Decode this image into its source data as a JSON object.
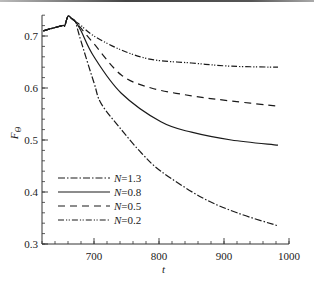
{
  "chart_data": {
    "type": "line",
    "title": "",
    "xlabel": "t",
    "ylabel": "F_Θ",
    "xlim": [
      620,
      1000
    ],
    "ylim": [
      0.3,
      0.74
    ],
    "xticks": [
      700,
      800,
      900,
      1000
    ],
    "xtick_labels": [
      "700",
      "800",
      "900",
      "1000"
    ],
    "x_minor_step": 20,
    "yticks": [
      0.3,
      0.4,
      0.5,
      0.6,
      0.7
    ],
    "ytick_labels": [
      "0.3",
      "0.4",
      "0.5",
      "0.6",
      "0.7"
    ],
    "y_minor_step": 0.02,
    "grid": false,
    "legend_position": "lower left",
    "shared_prefix": {
      "x": [
        622,
        651,
        655,
        660,
        666,
        671
      ],
      "y": [
        0.71,
        0.72,
        0.72,
        0.738,
        0.733,
        0.728
      ]
    },
    "series": [
      {
        "name": "N=1.3",
        "style": "dash-dot",
        "x": [
          680,
          700,
          711,
          742,
          773,
          803,
          865,
          920,
          983
        ],
        "y": [
          0.69,
          0.61,
          0.57,
          0.52,
          0.475,
          0.44,
          0.39,
          0.36,
          0.335
        ]
      },
      {
        "name": "N=0.8",
        "style": "solid",
        "x": [
          680,
          700,
          742,
          803,
          850,
          911,
          983
        ],
        "y": [
          0.71,
          0.66,
          0.59,
          0.535,
          0.515,
          0.5,
          0.49
        ]
      },
      {
        "name": "N=0.5",
        "style": "dashed",
        "x": [
          680,
          700,
          742,
          788,
          850,
          911,
          983
        ],
        "y": [
          0.715,
          0.685,
          0.625,
          0.6,
          0.585,
          0.575,
          0.565
        ]
      },
      {
        "name": "N=0.2",
        "style": "dash-dot-dot",
        "x": [
          680,
          700,
          742,
          788,
          850,
          911,
          983
        ],
        "y": [
          0.72,
          0.7,
          0.673,
          0.655,
          0.648,
          0.642,
          0.64
        ]
      }
    ],
    "legend": [
      {
        "prefix": "N",
        "label": "=1.3",
        "style": "dash-dot"
      },
      {
        "prefix": "N",
        "label": "=0.8",
        "style": "solid"
      },
      {
        "prefix": "N",
        "label": "=0.5",
        "style": "dashed"
      },
      {
        "prefix": "N",
        "label": "=0.2",
        "style": "dash-dot-dot"
      }
    ]
  }
}
